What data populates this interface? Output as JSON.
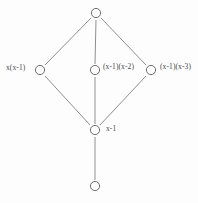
{
  "figure": {
    "type": "hasse-diagram",
    "background_color": "#fdfdfd",
    "edge_color": "#8e8e8e",
    "node_stroke_color": "#6e6e6e",
    "node_fill_color": "#fdfdfd",
    "label_color": "#4a4a4a"
  },
  "nodes": [
    {
      "id": "top",
      "label": "",
      "x": 96,
      "y": 13
    },
    {
      "id": "left",
      "label": "x(x-1)",
      "x": 40,
      "y": 70
    },
    {
      "id": "center",
      "label": "(x-1)(x-2)",
      "x": 95,
      "y": 70
    },
    {
      "id": "right",
      "label": "(x-1)(x-3)",
      "x": 151,
      "y": 70
    },
    {
      "id": "lower",
      "label": "x-1",
      "x": 95,
      "y": 130
    },
    {
      "id": "bottom",
      "label": "",
      "x": 95,
      "y": 186
    }
  ],
  "edges": [
    {
      "from": "top",
      "to": "left"
    },
    {
      "from": "top",
      "to": "center"
    },
    {
      "from": "top",
      "to": "right"
    },
    {
      "from": "left",
      "to": "lower"
    },
    {
      "from": "center",
      "to": "lower"
    },
    {
      "from": "right",
      "to": "lower"
    },
    {
      "from": "lower",
      "to": "bottom"
    }
  ]
}
